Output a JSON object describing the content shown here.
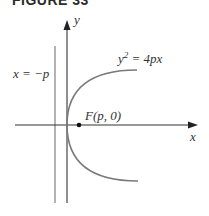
{
  "figure": {
    "title": "FIGURE 33"
  },
  "labels": {
    "y_axis": "y",
    "x_axis": "x",
    "directrix": "x = −p",
    "equation_base": "y",
    "equation_exp": "2",
    "equation_rest": " = 4px",
    "focus": "F(p, 0)"
  },
  "colors": {
    "axis": "#222222",
    "curve": "#777777",
    "directrix": "#777777",
    "text": "#333333"
  }
}
